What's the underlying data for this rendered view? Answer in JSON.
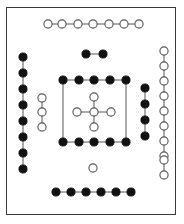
{
  "figure": {
    "width": 184,
    "height": 224,
    "background_color": "#ffffff",
    "frame": {
      "name": "outer-border",
      "x": 6,
      "y": 7,
      "width": 170,
      "height": 208,
      "stroke_color": "#3a3a3a",
      "stroke_width": 1
    },
    "node_styles": {
      "filled": {
        "fill_color": "#111111",
        "stroke_color": "#111111",
        "radius": 4.1
      },
      "open": {
        "fill_color": "#ffffff",
        "stroke_color": "#555555",
        "radius": 4.1
      }
    },
    "edge_style": {
      "stroke_color": "#666666",
      "stroke_width": 1.1
    }
  },
  "chart_data": {
    "type": "scatter",
    "xlabel": "",
    "ylabel": "",
    "xlim": [
      0,
      184
    ],
    "ylim": [
      224,
      0
    ],
    "grid": false,
    "legend": null,
    "groups": [
      {
        "name": "top-open-chain",
        "label": "Top horizontal open chain",
        "marker": "open",
        "orientation": "horizontal",
        "count": 7,
        "points": [
          {
            "x": 48,
            "y": 24
          },
          {
            "x": 62,
            "y": 24
          },
          {
            "x": 78,
            "y": 24
          },
          {
            "x": 93,
            "y": 24
          },
          {
            "x": 109,
            "y": 24
          },
          {
            "x": 124,
            "y": 24
          },
          {
            "x": 139,
            "y": 24
          }
        ],
        "edges": [
          [
            0,
            1
          ],
          [
            1,
            2
          ],
          [
            2,
            3
          ],
          [
            3,
            4
          ],
          [
            4,
            5
          ],
          [
            5,
            6
          ]
        ]
      },
      {
        "name": "upper-filled-pair",
        "label": "Upper filled pair",
        "marker": "filled",
        "orientation": "horizontal",
        "count": 2,
        "points": [
          {
            "x": 86,
            "y": 54
          },
          {
            "x": 103,
            "y": 54
          }
        ],
        "edges": [
          [
            0,
            1
          ]
        ]
      },
      {
        "name": "left-filled-column",
        "label": "Left vertical filled chain",
        "marker": "filled",
        "orientation": "vertical",
        "count": 8,
        "points": [
          {
            "x": 23,
            "y": 57
          },
          {
            "x": 23,
            "y": 73
          },
          {
            "x": 23,
            "y": 89
          },
          {
            "x": 23,
            "y": 105
          },
          {
            "x": 23,
            "y": 121
          },
          {
            "x": 23,
            "y": 137
          },
          {
            "x": 23,
            "y": 153
          },
          {
            "x": 23,
            "y": 169
          }
        ],
        "edges": [
          [
            0,
            1
          ],
          [
            1,
            2
          ],
          [
            2,
            3
          ],
          [
            3,
            4
          ],
          [
            4,
            5
          ],
          [
            5,
            6
          ],
          [
            6,
            7
          ]
        ]
      },
      {
        "name": "left-inner-open-column",
        "label": "Left inner vertical open chain",
        "marker": "open",
        "orientation": "vertical",
        "count": 3,
        "points": [
          {
            "x": 42,
            "y": 98
          },
          {
            "x": 42,
            "y": 112
          },
          {
            "x": 42,
            "y": 127
          }
        ],
        "edges": [
          [
            0,
            1
          ],
          [
            1,
            2
          ]
        ]
      },
      {
        "name": "center-box-top-row",
        "label": "Center box top filled row",
        "marker": "filled",
        "orientation": "horizontal",
        "count": 5,
        "points": [
          {
            "x": 63,
            "y": 80
          },
          {
            "x": 79,
            "y": 80
          },
          {
            "x": 94,
            "y": 80
          },
          {
            "x": 110,
            "y": 80
          },
          {
            "x": 126,
            "y": 80
          }
        ],
        "edges": [
          [
            0,
            1
          ],
          [
            1,
            2
          ],
          [
            2,
            3
          ],
          [
            3,
            4
          ]
        ]
      },
      {
        "name": "center-box-bottom-row",
        "label": "Center box bottom filled row",
        "marker": "filled",
        "orientation": "horizontal",
        "count": 5,
        "points": [
          {
            "x": 63,
            "y": 142
          },
          {
            "x": 79,
            "y": 142
          },
          {
            "x": 94,
            "y": 142
          },
          {
            "x": 110,
            "y": 142
          },
          {
            "x": 126,
            "y": 142
          }
        ],
        "edges": [
          [
            0,
            1
          ],
          [
            1,
            2
          ],
          [
            2,
            3
          ],
          [
            3,
            4
          ]
        ]
      },
      {
        "name": "center-box-sides",
        "label": "Center box vertical side edges",
        "marker": "none",
        "orientation": "vertical",
        "count": 0,
        "points": [],
        "edges": [],
        "connector_segments": [
          {
            "x1": 63,
            "y1": 80,
            "x2": 63,
            "y2": 142
          },
          {
            "x1": 126,
            "y1": 80,
            "x2": 126,
            "y2": 142
          }
        ]
      },
      {
        "name": "center-open-cross",
        "label": "Center open cross cluster",
        "marker": "open",
        "orientation": "cross",
        "count": 5,
        "points": [
          {
            "x": 94,
            "y": 97,
            "role": "north"
          },
          {
            "x": 77,
            "y": 112,
            "role": "west"
          },
          {
            "x": 94,
            "y": 112,
            "role": "center"
          },
          {
            "x": 111,
            "y": 112,
            "role": "east"
          },
          {
            "x": 94,
            "y": 127,
            "role": "south"
          }
        ],
        "edges": [
          [
            2,
            0
          ],
          [
            2,
            1
          ],
          [
            2,
            3
          ],
          [
            2,
            4
          ]
        ]
      },
      {
        "name": "right-inner-filled-column",
        "label": "Right inner vertical filled chain",
        "marker": "filled",
        "orientation": "vertical",
        "count": 4,
        "points": [
          {
            "x": 145,
            "y": 88
          },
          {
            "x": 145,
            "y": 104
          },
          {
            "x": 145,
            "y": 120
          },
          {
            "x": 145,
            "y": 136
          }
        ],
        "edges": [
          [
            0,
            1
          ],
          [
            1,
            2
          ],
          [
            2,
            3
          ]
        ]
      },
      {
        "name": "right-open-column",
        "label": "Right vertical open chain",
        "marker": "open",
        "orientation": "vertical",
        "count": 10,
        "points": [
          {
            "x": 164,
            "y": 51
          },
          {
            "x": 164,
            "y": 66
          },
          {
            "x": 164,
            "y": 81
          },
          {
            "x": 164,
            "y": 96
          },
          {
            "x": 164,
            "y": 111
          },
          {
            "x": 164,
            "y": 126
          },
          {
            "x": 164,
            "y": 141
          },
          {
            "x": 164,
            "y": 156
          },
          {
            "x": 164,
            "y": 160
          },
          {
            "x": 164,
            "y": 175
          }
        ],
        "edges": [
          [
            0,
            1
          ],
          [
            1,
            2
          ],
          [
            2,
            3
          ],
          [
            3,
            4
          ],
          [
            4,
            5
          ],
          [
            5,
            6
          ],
          [
            6,
            7
          ],
          [
            7,
            8
          ],
          [
            8,
            9
          ]
        ]
      },
      {
        "name": "lower-single-open-node",
        "label": "Lower isolated open node",
        "marker": "open",
        "orientation": "single",
        "count": 1,
        "points": [
          {
            "x": 93,
            "y": 168
          }
        ],
        "edges": []
      },
      {
        "name": "bottom-filled-chain",
        "label": "Bottom horizontal filled chain",
        "marker": "filled",
        "orientation": "horizontal",
        "count": 6,
        "points": [
          {
            "x": 56,
            "y": 192
          },
          {
            "x": 71,
            "y": 192
          },
          {
            "x": 86,
            "y": 192
          },
          {
            "x": 101,
            "y": 192
          },
          {
            "x": 116,
            "y": 192
          },
          {
            "x": 131,
            "y": 192
          }
        ],
        "edges": [
          [
            0,
            1
          ],
          [
            1,
            2
          ],
          [
            2,
            3
          ],
          [
            3,
            4
          ],
          [
            4,
            5
          ]
        ]
      }
    ]
  }
}
